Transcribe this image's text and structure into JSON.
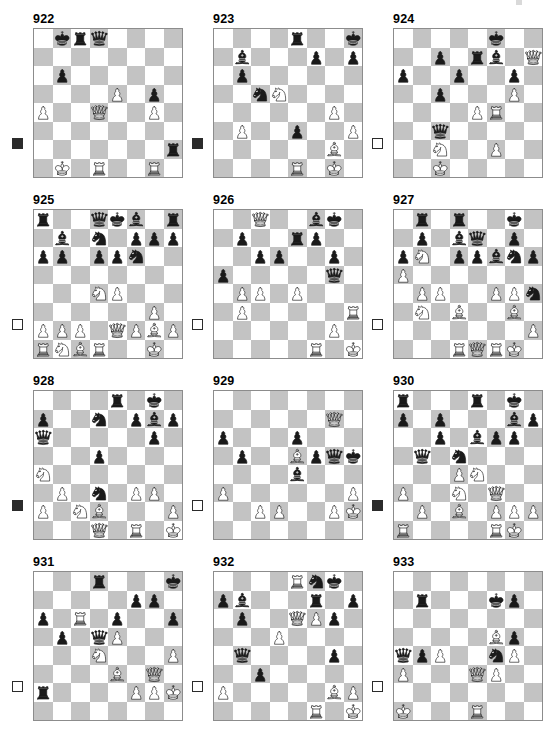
{
  "page": {
    "kind": "chess-puzzle-diagram-sheet",
    "columns": 3,
    "rows": 4,
    "colors": {
      "light_square": "#ffffff",
      "dark_square": "#c3c3c3",
      "border": "#8c8c8c",
      "piece_black": "#1a1a1a",
      "piece_white_fill": "#ffffff",
      "text": "#000000"
    },
    "legend": {
      "white_to_move_marker": "open square",
      "black_to_move_marker": "filled square"
    }
  },
  "diagrams": [
    {
      "number": "922",
      "side_to_move": "black",
      "ranks": [
        [
          null,
          "bk",
          "br",
          "bq",
          null,
          null,
          null,
          null
        ],
        [
          null,
          null,
          null,
          null,
          null,
          null,
          null,
          null
        ],
        [
          null,
          "bp",
          null,
          null,
          null,
          null,
          null,
          null
        ],
        [
          null,
          null,
          null,
          null,
          "wp",
          null,
          "bp",
          null
        ],
        [
          "wp",
          null,
          null,
          "wq",
          null,
          null,
          "wp",
          null
        ],
        [
          null,
          null,
          null,
          null,
          null,
          null,
          null,
          null
        ],
        [
          null,
          null,
          null,
          null,
          null,
          null,
          null,
          "br"
        ],
        [
          null,
          "wk",
          null,
          "wr",
          null,
          null,
          "wr",
          null
        ]
      ]
    },
    {
      "number": "923",
      "side_to_move": "black",
      "ranks": [
        [
          null,
          null,
          null,
          null,
          "br",
          null,
          null,
          "bk"
        ],
        [
          null,
          "bb",
          null,
          null,
          null,
          "bp",
          null,
          "bp"
        ],
        [
          null,
          "bp",
          null,
          null,
          null,
          null,
          null,
          null
        ],
        [
          null,
          null,
          "bn",
          "wn",
          null,
          null,
          null,
          null
        ],
        [
          null,
          null,
          null,
          null,
          null,
          null,
          "wp",
          null
        ],
        [
          null,
          "wp",
          null,
          null,
          "bp",
          null,
          null,
          "wp"
        ],
        [
          null,
          null,
          null,
          null,
          null,
          null,
          "wb",
          null
        ],
        [
          null,
          null,
          null,
          null,
          "wr",
          null,
          "wk",
          null
        ]
      ]
    },
    {
      "number": "924",
      "side_to_move": "white",
      "ranks": [
        [
          null,
          null,
          null,
          null,
          null,
          "bk",
          null,
          null
        ],
        [
          null,
          null,
          "bp",
          null,
          "br",
          "bb",
          null,
          "wq"
        ],
        [
          "bp",
          null,
          null,
          "bp",
          null,
          null,
          "bp",
          null
        ],
        [
          null,
          null,
          "bp",
          null,
          null,
          null,
          "wp",
          null
        ],
        [
          null,
          null,
          null,
          null,
          "wp",
          "wr",
          null,
          null
        ],
        [
          null,
          null,
          "bq",
          null,
          null,
          null,
          null,
          null
        ],
        [
          null,
          null,
          "wn",
          null,
          null,
          "wp",
          null,
          null
        ],
        [
          null,
          null,
          "wk",
          null,
          null,
          null,
          null,
          null
        ]
      ]
    },
    {
      "number": "925",
      "side_to_move": "white",
      "ranks": [
        [
          "br",
          null,
          null,
          "bq",
          "bk",
          "bb",
          null,
          "br"
        ],
        [
          null,
          "bb",
          null,
          "bn",
          null,
          "bp",
          "bp",
          "bp"
        ],
        [
          "bp",
          "bp",
          null,
          "bp",
          "bp",
          "bn",
          null,
          null
        ],
        [
          null,
          null,
          null,
          null,
          null,
          null,
          null,
          null
        ],
        [
          null,
          null,
          null,
          "wn",
          "wp",
          null,
          null,
          null
        ],
        [
          null,
          null,
          null,
          null,
          null,
          null,
          "wp",
          null
        ],
        [
          "wp",
          "wp",
          "wp",
          null,
          "wq",
          "wp",
          "wb",
          "wp"
        ],
        [
          "wr",
          "wn",
          "wb",
          "wr",
          null,
          null,
          "wk",
          null
        ]
      ]
    },
    {
      "number": "926",
      "side_to_move": "white",
      "ranks": [
        [
          null,
          null,
          "wq",
          null,
          null,
          "bb",
          "bk",
          null
        ],
        [
          null,
          "bp",
          null,
          null,
          "br",
          "bp",
          null,
          null
        ],
        [
          null,
          null,
          "bp",
          "bp",
          null,
          null,
          "bp",
          null
        ],
        [
          "bp",
          null,
          null,
          null,
          null,
          null,
          "bq",
          null
        ],
        [
          null,
          "wp",
          "wp",
          null,
          "wp",
          null,
          null,
          null
        ],
        [
          null,
          "wp",
          null,
          null,
          null,
          null,
          null,
          "wr"
        ],
        [
          null,
          null,
          null,
          null,
          null,
          null,
          "wp",
          null
        ],
        [
          null,
          null,
          null,
          null,
          null,
          "wr",
          null,
          "wk"
        ]
      ]
    },
    {
      "number": "927",
      "side_to_move": "white",
      "ranks": [
        [
          null,
          "br",
          null,
          "br",
          null,
          null,
          "bk",
          null
        ],
        [
          null,
          "bp",
          null,
          "bb",
          "bq",
          null,
          "bp",
          null
        ],
        [
          "bp",
          "wn",
          null,
          "bp",
          "bp",
          "bb",
          "bn",
          "bp"
        ],
        [
          "wp",
          null,
          null,
          null,
          null,
          null,
          null,
          null
        ],
        [
          null,
          "wp",
          "wp",
          null,
          null,
          "wp",
          "wp",
          "bn"
        ],
        [
          null,
          "wn",
          null,
          "wb",
          null,
          null,
          "wb",
          null
        ],
        [
          null,
          null,
          null,
          null,
          null,
          null,
          null,
          "wp"
        ],
        [
          null,
          null,
          null,
          "wr",
          "wq",
          "wr",
          "wk",
          null
        ]
      ]
    },
    {
      "number": "928",
      "side_to_move": "black",
      "ranks": [
        [
          null,
          null,
          null,
          null,
          "br",
          null,
          "bk",
          null
        ],
        [
          "bp",
          null,
          null,
          "bn",
          null,
          "bp",
          "bb",
          "bp"
        ],
        [
          "bq",
          null,
          null,
          null,
          null,
          null,
          "bp",
          null
        ],
        [
          null,
          null,
          null,
          "bp",
          null,
          null,
          null,
          null
        ],
        [
          "wn",
          null,
          null,
          null,
          null,
          null,
          null,
          null
        ],
        [
          null,
          "wp",
          null,
          "bn",
          null,
          "wp",
          "wp",
          null
        ],
        [
          "wp",
          null,
          "wn",
          "wb",
          null,
          null,
          null,
          "wp"
        ],
        [
          null,
          null,
          null,
          "wq",
          null,
          "wr",
          null,
          "wk"
        ]
      ]
    },
    {
      "number": "929",
      "side_to_move": "white",
      "ranks": [
        [
          null,
          null,
          null,
          null,
          null,
          null,
          null,
          null
        ],
        [
          null,
          null,
          null,
          null,
          null,
          null,
          "wq",
          null
        ],
        [
          "bp",
          null,
          null,
          null,
          "bp",
          null,
          null,
          null
        ],
        [
          null,
          "bp",
          null,
          null,
          "wb",
          "bp",
          "bq",
          "bk"
        ],
        [
          null,
          null,
          null,
          null,
          "bb",
          null,
          null,
          null
        ],
        [
          "wp",
          null,
          null,
          null,
          null,
          null,
          null,
          "wp"
        ],
        [
          null,
          null,
          "wp",
          "wp",
          null,
          null,
          "wp",
          "wk"
        ],
        [
          null,
          null,
          null,
          null,
          null,
          null,
          null,
          null
        ]
      ]
    },
    {
      "number": "930",
      "side_to_move": "black",
      "ranks": [
        [
          "br",
          null,
          null,
          null,
          "br",
          null,
          "bk",
          null
        ],
        [
          "bp",
          null,
          "bp",
          null,
          null,
          null,
          "bb",
          "bp"
        ],
        [
          null,
          null,
          "bp",
          null,
          "bb",
          "bp",
          "bp",
          null
        ],
        [
          null,
          "bq",
          null,
          "bn",
          null,
          null,
          null,
          null
        ],
        [
          null,
          null,
          null,
          "wp",
          "wn",
          null,
          null,
          null
        ],
        [
          "wp",
          null,
          null,
          "wn",
          null,
          "wq",
          null,
          null
        ],
        [
          null,
          "wp",
          null,
          "wb",
          null,
          "wp",
          "wp",
          "wp"
        ],
        [
          "wr",
          null,
          null,
          null,
          null,
          "wr",
          "wk",
          null
        ]
      ]
    },
    {
      "number": "931",
      "side_to_move": "white",
      "ranks": [
        [
          null,
          null,
          null,
          "br",
          null,
          null,
          null,
          "bk"
        ],
        [
          null,
          null,
          null,
          null,
          null,
          "bp",
          "bp",
          null
        ],
        [
          "bp",
          null,
          "wr",
          null,
          "bp",
          null,
          null,
          "bp"
        ],
        [
          null,
          "bp",
          null,
          "bq",
          "wp",
          null,
          null,
          null
        ],
        [
          null,
          null,
          null,
          "wn",
          null,
          null,
          null,
          "wp"
        ],
        [
          null,
          null,
          null,
          null,
          "wb",
          null,
          "wq",
          null
        ],
        [
          "br",
          null,
          null,
          null,
          null,
          "wp",
          "wp",
          "wk"
        ],
        [
          null,
          null,
          null,
          null,
          null,
          null,
          null,
          null
        ]
      ]
    },
    {
      "number": "932",
      "side_to_move": "white",
      "ranks": [
        [
          null,
          null,
          null,
          null,
          "wr",
          "bn",
          "bk",
          null
        ],
        [
          "bp",
          "bb",
          null,
          null,
          null,
          "br",
          null,
          "bp"
        ],
        [
          null,
          "bp",
          null,
          null,
          "wq",
          "wp",
          "bp",
          null
        ],
        [
          null,
          null,
          null,
          "wp",
          null,
          null,
          null,
          null
        ],
        [
          null,
          "bq",
          null,
          null,
          null,
          null,
          "bp",
          null
        ],
        [
          null,
          null,
          "bp",
          null,
          null,
          null,
          null,
          null
        ],
        [
          "wp",
          null,
          null,
          null,
          null,
          null,
          "wb",
          "wp"
        ],
        [
          null,
          null,
          null,
          null,
          null,
          "wr",
          null,
          "wk"
        ]
      ]
    },
    {
      "number": "933",
      "side_to_move": "white",
      "ranks": [
        [
          null,
          null,
          null,
          null,
          null,
          null,
          null,
          null
        ],
        [
          null,
          "br",
          null,
          null,
          null,
          "bk",
          "bp",
          null
        ],
        [
          null,
          null,
          null,
          null,
          null,
          null,
          null,
          null
        ],
        [
          null,
          null,
          null,
          null,
          null,
          "wb",
          "bp",
          null
        ],
        [
          "bq",
          "bp",
          "wp",
          null,
          null,
          "bn",
          "wp",
          null
        ],
        [
          "wp",
          null,
          null,
          null,
          "wq",
          "wp",
          null,
          null
        ],
        [
          null,
          null,
          null,
          null,
          null,
          null,
          null,
          null
        ],
        [
          "wk",
          null,
          null,
          null,
          "wr",
          null,
          null,
          null
        ]
      ]
    }
  ]
}
